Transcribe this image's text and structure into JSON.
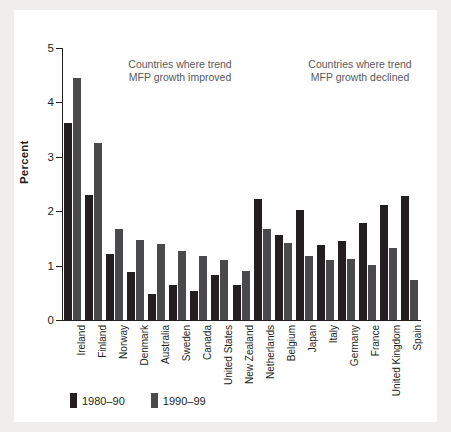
{
  "figure": {
    "background": "#ffffff",
    "page_background": "#efeeec"
  },
  "chart_data": {
    "type": "bar",
    "title": "",
    "xlabel": "",
    "ylabel": "Percent",
    "ylim": [
      0,
      5
    ],
    "yticks": [
      0,
      1,
      2,
      3,
      4,
      5
    ],
    "ytick_labels": [
      "0",
      "1",
      "2",
      "3",
      "4",
      "5"
    ],
    "grid": false,
    "legend_position": "bottom-left",
    "categories": [
      "Ireland",
      "Finland",
      "Norway",
      "Denmark",
      "Australia",
      "Sweden",
      "Canada",
      "United States",
      "New Zealand",
      "Netherlands",
      "Belgium",
      "Japan",
      "Italy",
      "Germany",
      "France",
      "United Kingdom",
      "Spain"
    ],
    "series": [
      {
        "name": "1980–90",
        "color": "#231f20",
        "values": [
          3.62,
          2.3,
          1.22,
          0.88,
          0.48,
          0.65,
          0.53,
          0.82,
          0.65,
          2.22,
          1.57,
          2.03,
          1.37,
          1.45,
          1.78,
          2.12,
          2.28
        ]
      },
      {
        "name": "1990–99",
        "color": "#4a4a4c",
        "values": [
          4.45,
          3.25,
          1.68,
          1.48,
          1.4,
          1.27,
          1.17,
          1.1,
          0.9,
          1.68,
          1.42,
          1.17,
          1.1,
          1.13,
          1.02,
          1.33,
          0.73
        ]
      }
    ],
    "annotations": [
      {
        "text": "Countries where trend\nMFP growth improved",
        "position": "upper-left"
      },
      {
        "text": "Countries where trend\nMFP growth declined",
        "position": "upper-right"
      }
    ]
  }
}
